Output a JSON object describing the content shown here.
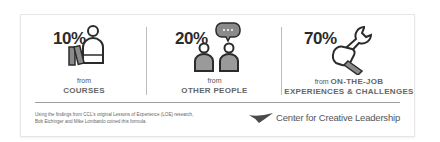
{
  "segments": [
    {
      "percent": "10%",
      "from": "from",
      "label": "COURSES",
      "icon": "person-reading-books-icon"
    },
    {
      "percent": "20%",
      "from": "from",
      "label": "OTHER PEOPLE",
      "icon": "two-people-chat-icon"
    },
    {
      "percent": "70%",
      "from": "from",
      "label_inline": "ON-THE-JOB",
      "label": "EXPERIENCES & CHALLENGES",
      "icon": "hand-wrench-icon"
    }
  ],
  "footnote": {
    "line1": "Using the findings from CCL's original Lessons of Experience (LOE) research,",
    "line2": "Bob Eichinger and Mike Lombardo coined this formula."
  },
  "logo": {
    "text": "Center for Creative Leadership",
    "mark": "ccl-swoosh-logo"
  },
  "colors": {
    "text_dark": "#2b2b2b",
    "label_gray": "#666666",
    "icon_fill": "#8a8a8a",
    "divider": "#bdbdbd"
  }
}
